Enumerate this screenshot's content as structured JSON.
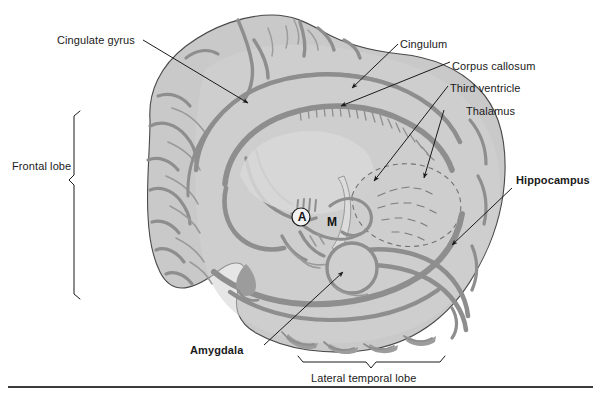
{
  "figure": {
    "colors": {
      "cortex_fill": "#c9c9c9",
      "cortex_fill_light": "#d4d4d4",
      "sulci_dark": "#8e8e8e",
      "outline": "#4a4a4a",
      "leader_line": "#1a1a1a",
      "text": "#1a1a1a",
      "baseline_rule": "#3b3b3b",
      "page_background": "#ffffff"
    }
  },
  "labels": {
    "cingulate_gyrus": "Cingulate gyrus",
    "cingulum": "Cingulum",
    "corpus_callosum": "Corpus callosum",
    "third_ventricle": "Third ventricle",
    "thalamus": "Thalamus",
    "hippocampus": "Hippocampus",
    "amygdala": "Amygdala",
    "frontal_lobe": "Frontal lobe",
    "lateral_temporal_lobe": "Lateral temporal lobe"
  },
  "inline_markers": {
    "anterior_commissure": "A",
    "mammillary_body": "M"
  },
  "brackets": {
    "frontal_lobe_bracket": "frontal-lobe-bracket",
    "lateral_temporal_lobe_bracket": "lateral-temporal-lobe-bracket"
  },
  "leaders": {
    "cingulate_gyrus": "leader-cingulate-gyrus",
    "cingulum": "leader-cingulum",
    "corpus_callosum": "leader-corpus-callosum",
    "third_ventricle": "leader-third-ventricle",
    "thalamus": "leader-thalamus",
    "hippocampus": "leader-hippocampus",
    "amygdala": "leader-amygdala"
  }
}
